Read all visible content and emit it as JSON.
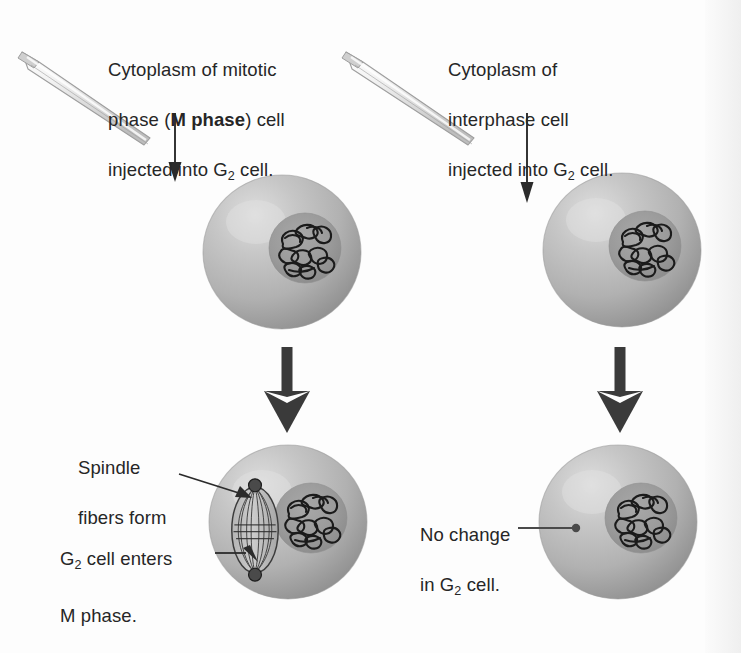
{
  "figure": {
    "title_sr": "Cell fusion experiment: cytoplasm injection into G2 cells",
    "colors": {
      "background": "#fdfdfd",
      "cell_fill": "#b0b0b0",
      "cell_highlight": "#d9d9d9",
      "cell_shadow": "#8f8f8f",
      "nucleus_fill": "#9a9a9a",
      "chromatin_stroke": "#1c1c1c",
      "pipette_fill": "#ededed",
      "pipette_stroke": "#9a9a9a",
      "arrow_dark": "#3a3a3a",
      "leader_line": "#3a3a3a",
      "text": "#262626"
    }
  },
  "columns": [
    {
      "id": "left",
      "caption_line1": "Cytoplasm of mitotic",
      "caption_line2_pre": "phase (",
      "caption_line2_bold": "M phase",
      "caption_line2_post": ") cell",
      "caption_line3_pre": "injected into G",
      "caption_line3_sub": "2",
      "caption_line3_post": " cell.",
      "top_cell_name": "g2-cell-top-left",
      "bottom_cell_name": "g2-cell-bottom-left",
      "result_labels": [
        {
          "name": "spindle-fibers-label",
          "line1": "Spindle",
          "line2": "fibers form"
        },
        {
          "name": "g2-enters-m-phase-label",
          "line1_pre": "G",
          "line1_sub": "2",
          "line1_post": " cell enters",
          "line2": "M phase."
        }
      ]
    },
    {
      "id": "right",
      "caption_line1": "Cytoplasm of",
      "caption_line2": "interphase cell",
      "caption_line3_pre": "injected into G",
      "caption_line3_sub": "2",
      "caption_line3_post": " cell.",
      "top_cell_name": "g2-cell-top-right",
      "bottom_cell_name": "g2-cell-bottom-right",
      "result_labels": [
        {
          "name": "no-change-label",
          "line1": "No change",
          "line2_pre": "in G",
          "line2_sub": "2",
          "line2_post": " cell."
        }
      ]
    }
  ]
}
